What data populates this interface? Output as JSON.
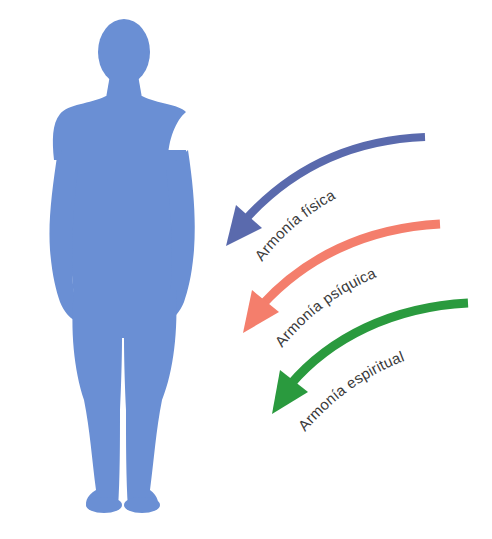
{
  "diagram": {
    "figure": {
      "name": "human-silhouette",
      "color": "#6a8fd4"
    },
    "arrows": [
      {
        "label": "Armonía física",
        "color": "#5a6aad"
      },
      {
        "label": "Armonía psíquica",
        "color": "#f47e6c"
      },
      {
        "label": "Armonía espiritual",
        "color": "#2a9a3e"
      }
    ]
  }
}
